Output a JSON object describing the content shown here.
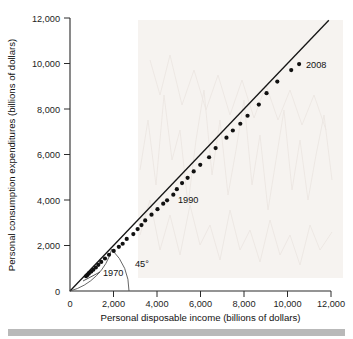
{
  "chart_data": {
    "type": "scatter",
    "title": "",
    "xlabel": "Personal disposable income (billions of dollars)",
    "ylabel": "Personal consumption expenditures (billions of dollars)",
    "xlim": [
      0,
      12000
    ],
    "ylim": [
      0,
      12000
    ],
    "xticks": [
      0,
      2000,
      4000,
      6000,
      8000,
      10000,
      12000
    ],
    "yticks": [
      0,
      2000,
      4000,
      6000,
      8000,
      10000,
      12000
    ],
    "xtick_labels": [
      "0",
      "2,000",
      "4,000",
      "6,000",
      "8,000",
      "10,000",
      "12,000"
    ],
    "ytick_labels": [
      "0",
      "2,000",
      "4,000",
      "6,000",
      "8,000",
      "10,000",
      "12,000"
    ],
    "grid": false,
    "legend": "none",
    "series": [
      {
        "name": "Consumption vs. disposable income, 1970-2008",
        "marker": "filled-circle",
        "marker_color": "#111111",
        "points": [
          {
            "year": 1970,
            "x": 736,
            "y": 648
          },
          {
            "year": 1971,
            "x": 801,
            "y": 702
          },
          {
            "year": 1972,
            "x": 869,
            "y": 771
          },
          {
            "year": 1973,
            "x": 978,
            "y": 852
          },
          {
            "year": 1974,
            "x": 1071,
            "y": 933
          },
          {
            "year": 1975,
            "x": 1187,
            "y": 1034
          },
          {
            "year": 1976,
            "x": 1302,
            "y": 1152
          },
          {
            "year": 1977,
            "x": 1435,
            "y": 1278
          },
          {
            "year": 1978,
            "x": 1608,
            "y": 1428
          },
          {
            "year": 1979,
            "x": 1793,
            "y": 1593
          },
          {
            "year": 1980,
            "x": 2009,
            "y": 1760
          },
          {
            "year": 1981,
            "x": 2246,
            "y": 1941
          },
          {
            "year": 1982,
            "x": 2421,
            "y": 2077
          },
          {
            "year": 1983,
            "x": 2608,
            "y": 2290
          },
          {
            "year": 1984,
            "x": 2912,
            "y": 2503
          },
          {
            "year": 1985,
            "x": 3109,
            "y": 2720
          },
          {
            "year": 1986,
            "x": 3285,
            "y": 2900
          },
          {
            "year": 1987,
            "x": 3458,
            "y": 3100
          },
          {
            "year": 1988,
            "x": 3748,
            "y": 3353
          },
          {
            "year": 1989,
            "x": 4022,
            "y": 3598
          },
          {
            "year": 1990,
            "x": 4286,
            "y": 3840
          },
          {
            "year": 1991,
            "x": 4464,
            "y": 3986
          },
          {
            "year": 1992,
            "x": 4751,
            "y": 4235
          },
          {
            "year": 1993,
            "x": 4912,
            "y": 4478
          },
          {
            "year": 1994,
            "x": 5152,
            "y": 4743
          },
          {
            "year": 1995,
            "x": 5408,
            "y": 4976
          },
          {
            "year": 1996,
            "x": 5688,
            "y": 5257
          },
          {
            "year": 1997,
            "x": 5988,
            "y": 5547
          },
          {
            "year": 1998,
            "x": 6395,
            "y": 5880
          },
          {
            "year": 1999,
            "x": 6695,
            "y": 6282
          },
          {
            "year": 2000,
            "x": 7194,
            "y": 6739
          },
          {
            "year": 2001,
            "x": 7487,
            "y": 7055
          },
          {
            "year": 2002,
            "x": 7830,
            "y": 7351
          },
          {
            "year": 2003,
            "x": 8163,
            "y": 7704
          },
          {
            "year": 2004,
            "x": 8681,
            "y": 8196
          },
          {
            "year": 2005,
            "x": 9036,
            "y": 8694
          },
          {
            "year": 2006,
            "x": 9531,
            "y": 9207
          },
          {
            "year": 2007,
            "x": 10171,
            "y": 9710
          },
          {
            "year": 2008,
            "x": 10534,
            "y": 9976
          }
        ]
      }
    ],
    "reference_line": {
      "name": "45-degree line",
      "label": "45°",
      "from": [
        0,
        0
      ],
      "to": [
        11900,
        11900
      ],
      "slope": 1,
      "color": "#151515"
    },
    "annotations": [
      {
        "name": "point-label-1970",
        "text": "1970",
        "x": 2100,
        "y": 700
      },
      {
        "name": "point-label-1990",
        "text": "1990",
        "x": 5000,
        "y": 3900
      },
      {
        "name": "point-label-2008",
        "text": "2008",
        "x": 11100,
        "y": 9900
      },
      {
        "name": "angle-label",
        "text": "45°",
        "x": 3400,
        "y": 1300
      }
    ]
  },
  "axes": {
    "y_title": "Personal consumption expenditures (billions of dollars)",
    "x_title": "Personal disposable income (billions of dollars)",
    "x_tick_labels": [
      "0",
      "2,000",
      "4,000",
      "6,000",
      "8,000",
      "10,000",
      "12,000"
    ],
    "y_tick_labels": [
      "0",
      "2,000",
      "4,000",
      "6,000",
      "8,000",
      "10,000",
      "12,000"
    ]
  },
  "labels": {
    "year_first": "1970",
    "year_mid": "1990",
    "year_last": "2008",
    "angle": "45°"
  },
  "colors": {
    "marker": "#111111",
    "axis": "#2b2b2b",
    "reference_line": "#151515",
    "footer_bar": "#b9b9b9",
    "watermark": "#ece7e2",
    "background": "#ffffff"
  }
}
